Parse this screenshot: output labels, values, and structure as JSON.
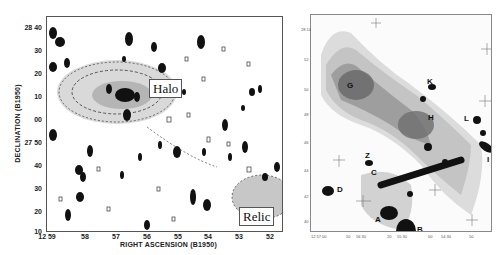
{
  "figure": {
    "left_panel": {
      "y_axis_label": "DECLINATION (B1950)",
      "x_axis_label": "RIGHT ASCENSION (B1950)",
      "y_ticks": [
        "28 40",
        "30",
        "20",
        "10",
        "00",
        "27 50",
        "40",
        "30",
        "20",
        "10"
      ],
      "x_ticks": [
        "12 59",
        "58",
        "57",
        "56",
        "55",
        "54",
        "53",
        "52"
      ],
      "annotations": {
        "halo": "Halo",
        "relic": "Relic"
      }
    },
    "right_panel": {
      "source_labels": {
        "G": "G",
        "K": "K",
        "H": "H",
        "L": "L",
        "I": "I",
        "Z": "Z",
        "C": "C",
        "D": "D",
        "A": "A",
        "B": "B"
      },
      "y_ticks": [
        "28 14",
        "52",
        "50",
        "48",
        "46",
        "44",
        "42",
        "40"
      ],
      "x_ticks": [
        "12 57 00",
        "50",
        "56 30",
        "20",
        "55 30",
        "00",
        "54 30",
        "50"
      ]
    }
  }
}
